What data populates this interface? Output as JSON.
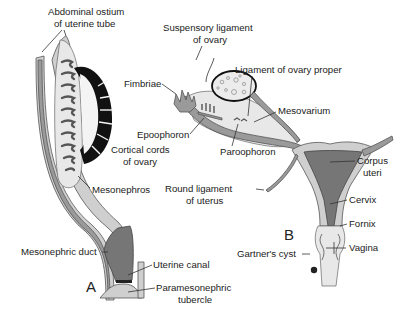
{
  "figure": {
    "panels": [
      {
        "id": "A",
        "label": "A"
      },
      {
        "id": "B",
        "label": "B"
      }
    ],
    "labels": {
      "abdominal_ostium_1": "Abdominal ostium",
      "abdominal_ostium_2": "of uterine tube",
      "cortical_cords_1": "Cortical cords",
      "cortical_cords_2": "of ovary",
      "mesonephros": "Mesonephros",
      "mesonephric_duct": "Mesonephric duct",
      "uterine_canal": "Uterine canal",
      "paramesonephric_tubercle_1": "Paramesonephric",
      "paramesonephric_tubercle_2": "tubercle",
      "suspensory_ligament_1": "Suspensory ligament",
      "suspensory_ligament_2": "of ovary",
      "fimbriae": "Fimbriae",
      "ligament_ovary_proper": "Ligament of ovary proper",
      "mesovarium": "Mesovarium",
      "epoophoron": "Epoophoron",
      "paroophoron": "Paroophoron",
      "round_ligament_1": "Round ligament",
      "round_ligament_2": "of uterus",
      "corpus_uteri_1": "Corpus",
      "corpus_uteri_2": "uteri",
      "cervix": "Cervix",
      "fornix": "Fornix",
      "vagina": "Vagina",
      "gartners_cyst": "Gartner's cyst"
    }
  }
}
